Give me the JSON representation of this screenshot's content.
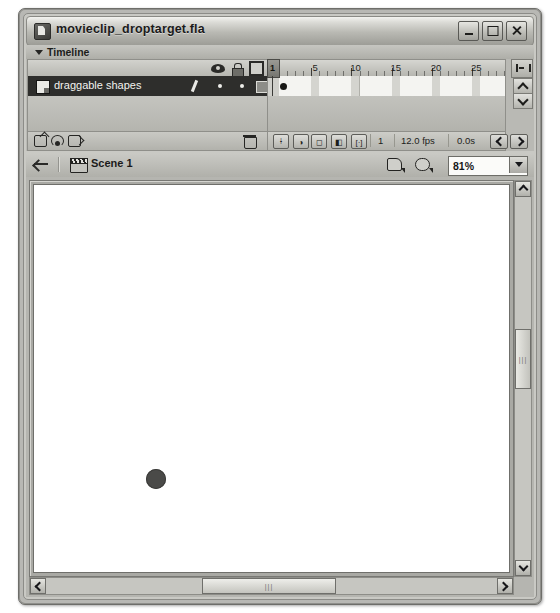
{
  "window": {
    "title": "movieclip_droptarget.fla",
    "app_icon": "flash-document-icon",
    "controls": {
      "minimize": "minimize-button",
      "maximize": "maximize-button",
      "close": "close-button"
    }
  },
  "timeline": {
    "panel_title": "Timeline",
    "collapse_icon": "triangle-down-icon",
    "columns": {
      "eye": "eye-icon",
      "lock": "lock-icon",
      "outline": "outline-square-icon"
    },
    "layers": [
      {
        "name": "draggable shapes",
        "selected": true,
        "icon": "layer-icon",
        "edit_icon": "pencil-icon"
      }
    ],
    "layer_tools": {
      "insert_layer": "insert-layer-icon",
      "add_motion_guide": "motion-guide-icon",
      "insert_folder": "insert-folder-icon",
      "delete_layer": "trash-icon"
    },
    "ruler_labels": [
      "1",
      "5",
      "10",
      "15",
      "20",
      "25"
    ],
    "ruler_positions": [
      1,
      5,
      10,
      15,
      20,
      25
    ],
    "playhead_frame": "1",
    "keyframe_frames": [
      1
    ],
    "total_cells": 30,
    "status": {
      "center_frame": "center-frame-button",
      "onion_skin": "onion-skin-button",
      "onion_outlines": "onion-outlines-button",
      "edit_multiple": "edit-multiple-frames-button",
      "modify_markers": "modify-onion-markers-button",
      "current_frame": "1",
      "frame_rate": "12.0 fps",
      "elapsed_time": "0.0s",
      "prev_label": "previous-keyframe",
      "next_label": "next-keyframe"
    },
    "frame_view_button": "frame-view-menu-icon",
    "scroll_up": "scroll-up-icon",
    "scroll_down": "scroll-down-icon"
  },
  "edit_bar": {
    "back_icon": "back-arrow-icon",
    "scene_icon": "scene-clapper-icon",
    "scene_name": "Scene 1",
    "edit_scene_icon": "edit-scene-icon",
    "edit_symbol_icon": "edit-symbol-icon",
    "zoom_value": "81%",
    "zoom_dropdown_icon": "chevron-down-icon"
  },
  "stage": {
    "background_color": "#ffffff",
    "objects": [
      {
        "type": "circle",
        "name": "draggable-circle",
        "x": 112,
        "y": 284,
        "diameter": 20,
        "color": "#4a4a48"
      }
    ]
  },
  "scrollbars": {
    "vertical": {
      "up": "scroll-up-icon",
      "down": "scroll-down-icon",
      "grip": "|||"
    },
    "horizontal": {
      "left": "scroll-left-icon",
      "right": "scroll-right-icon",
      "grip": "|||"
    }
  }
}
